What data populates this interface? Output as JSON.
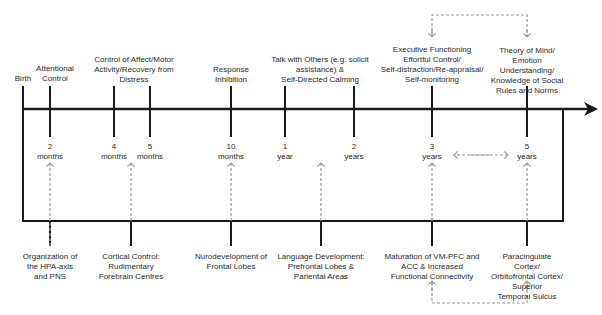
{
  "timeline": {
    "start_label": "Birth",
    "milestones": [
      {
        "age": "2\nmonths",
        "x": 50,
        "above": "Attentional\nControl",
        "below": "Organization of\nthe HPA-axis\nand PNS"
      },
      {
        "age": "4\nmonths",
        "x": 114,
        "above": "",
        "below": "Cortical Control:\nRudimentary\nForebrain Centres"
      },
      {
        "age": "5\nmonths",
        "x": 150,
        "above": "",
        "below": ""
      },
      {
        "age": "10\nmonths",
        "x": 231,
        "above": "Response\nInhibition",
        "below": "Nurodevelopment of\nFrontal Lobes"
      },
      {
        "age": "1\nyear",
        "x": 285,
        "above": "",
        "below": ""
      },
      {
        "age": "2\nyears",
        "x": 354,
        "above": "",
        "below": "Language Development:\nPrefrontal Lobes &\nPariental Areas"
      },
      {
        "age": "3\nyears",
        "x": 432,
        "above": "Executive Functioning\nEffortful Control/\nSelf-distraction/Re-appraisal/\nSelf-monitoring",
        "below": "Maturation of VM-PFC and\nACC & Increased\nFunctional Connectivity"
      },
      {
        "age": "5\nyears",
        "x": 527,
        "above": "Theory of Mind/\nEmotion Understanding/\nKnowledge of Social\nRules and Norms",
        "below": "Paracingulate Cortex/\nOrbitofrontal Cortex/ Superior\nTemporal Sulcus"
      }
    ],
    "spanning_labels": {
      "affect_control": "Control of Affect/Motor\nActivity/Recovery from\nDistress",
      "talk_with_others": "Talk with Others (e.g. solicit\nassistance) &\nSelf-Directed Calming"
    }
  },
  "colors": {
    "line": "#1a1a1a",
    "dashed": "#9a9a9a",
    "text": "#2a2a2a"
  }
}
